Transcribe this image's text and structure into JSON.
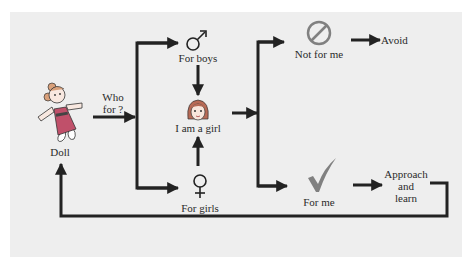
{
  "diagram": {
    "nodes": {
      "doll": {
        "label": "Doll",
        "icon": "doll-icon"
      },
      "question": {
        "line1": "Who",
        "line2": "for ?"
      },
      "for_boys": {
        "label": "For boys",
        "icon": "male-symbol-icon",
        "glyph": "♂"
      },
      "for_girls": {
        "label": "For girls",
        "icon": "female-symbol-icon",
        "glyph": "♀"
      },
      "i_am_a_girl": {
        "label": "I am a girl",
        "icon": "girl-face-icon"
      },
      "not_for_me": {
        "label": "Not for me",
        "icon": "prohibited-icon"
      },
      "avoid": {
        "label": "Avoid"
      },
      "for_me": {
        "label": "For me",
        "icon": "checkmark-icon",
        "glyph": "✓"
      },
      "approach": {
        "line1": "Approach",
        "line2": "and",
        "line3": "learn"
      }
    },
    "colors": {
      "background": "#eeeeee",
      "arrow": "#222222",
      "icon_gray": "#808080",
      "doll_dress": "#c0506a",
      "doll_hair": "#d9a07a"
    }
  }
}
